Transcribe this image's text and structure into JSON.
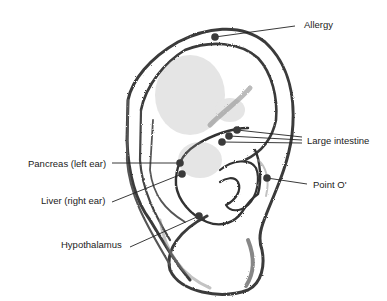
{
  "diagram": {
    "point_color": "#3a3a3a",
    "line_color": "#222222",
    "labels": [
      {
        "id": "allergy",
        "text": "Allergy",
        "x": 304,
        "y": 20
      },
      {
        "id": "large-intestine",
        "text": "Large intestine",
        "x": 307,
        "y": 136
      },
      {
        "id": "point-o",
        "text": "Point O'",
        "x": 313,
        "y": 180
      },
      {
        "id": "pancreas",
        "text": "Pancreas (left ear)",
        "x": 28,
        "y": 159
      },
      {
        "id": "liver",
        "text": "Liver (right ear)",
        "x": 41,
        "y": 196
      },
      {
        "id": "hypothalamus",
        "text": "Hypothalamus",
        "x": 61,
        "y": 240
      }
    ],
    "points": [
      {
        "label": "Allergy",
        "x": 215,
        "y": 37
      },
      {
        "label": "Large intestine",
        "x": 237,
        "y": 130
      },
      {
        "label": "Large intestine",
        "x": 229,
        "y": 136
      },
      {
        "label": "Large intestine",
        "x": 222,
        "y": 142
      },
      {
        "label": "Pancreas (left ear)",
        "x": 180,
        "y": 163
      },
      {
        "label": "Liver (right ear)",
        "x": 182,
        "y": 174
      },
      {
        "label": "Hypothalamus",
        "x": 199,
        "y": 216
      },
      {
        "label": "Point O'",
        "x": 267,
        "y": 178
      }
    ]
  }
}
